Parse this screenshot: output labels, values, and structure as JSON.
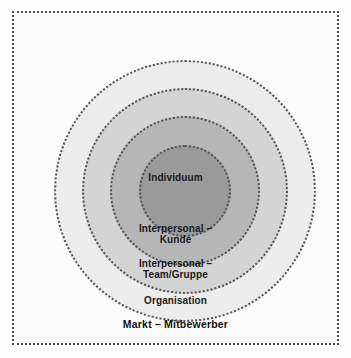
{
  "diagram": {
    "background_color": "#fdfdfd",
    "frame": {
      "border_style": "dotted",
      "border_color": "#4a4a4a"
    },
    "levels": [
      {
        "id": "markt",
        "label": "Markt – Mitbewerber",
        "order": 5,
        "fill_color": "#fbfbfb",
        "shape": "rectangle"
      },
      {
        "id": "organisation",
        "label": "Organisation",
        "order": 4,
        "fill_color": "#ececec",
        "shape": "circle"
      },
      {
        "id": "team",
        "label": "Interpersonal –\nTeam/Gruppe",
        "order": 3,
        "fill_color": "#d4d4d4",
        "shape": "circle"
      },
      {
        "id": "kunde",
        "label": "Interpersonal –\nKunde",
        "order": 2,
        "fill_color": "#b6b6b6",
        "shape": "circle"
      },
      {
        "id": "individuum",
        "label": "Individuum",
        "order": 1,
        "fill_color": "#9a9a9a",
        "shape": "circle"
      }
    ]
  }
}
